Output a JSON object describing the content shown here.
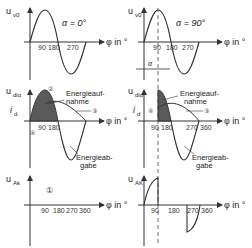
{
  "diagram": {
    "x_axis_label": "φ in °",
    "panels": [
      {
        "id": "top-left",
        "y_label": "u",
        "y_sub": "v0",
        "annotation": "α = 0°",
        "ticks": [
          "90",
          "180",
          "270"
        ]
      },
      {
        "id": "top-right",
        "y_label": "u",
        "y_sub": "v0",
        "annotation": "α = 90°",
        "ticks": [
          "90",
          "180",
          "270"
        ],
        "alpha_marker": "α"
      },
      {
        "id": "mid-left",
        "y_label": "u",
        "y_sub": "diα",
        "current_label": "i",
        "current_sub": "d",
        "ticks": [
          "90",
          "180"
        ],
        "energy_in": [
          "Energieauf-",
          "nahme"
        ],
        "energy_out": [
          "Energieab-",
          "gabe"
        ],
        "markers": [
          "②",
          "③",
          "④"
        ]
      },
      {
        "id": "mid-right",
        "y_label": "u",
        "y_sub": "diα",
        "current_label": "i",
        "current_sub": "d",
        "ticks": [
          "90",
          "180",
          "270",
          "360"
        ],
        "energy_in": [
          "Energieauf-",
          "nahme"
        ],
        "energy_out": [
          "Energieab-",
          "gabe"
        ],
        "markers": [
          "③",
          "④"
        ]
      },
      {
        "id": "bottom-left",
        "y_label": "u",
        "y_sub": "Ak",
        "ticks": [
          "90",
          "180",
          "270",
          "360"
        ],
        "markers": [
          "①"
        ]
      },
      {
        "id": "bottom-right",
        "y_label": "u",
        "y_sub": "AK",
        "ticks": [
          "90",
          "180",
          "270",
          "360"
        ]
      }
    ],
    "colors": {
      "line": "#333333",
      "fill": "#5a5a5a",
      "dashed": "#444444"
    }
  }
}
